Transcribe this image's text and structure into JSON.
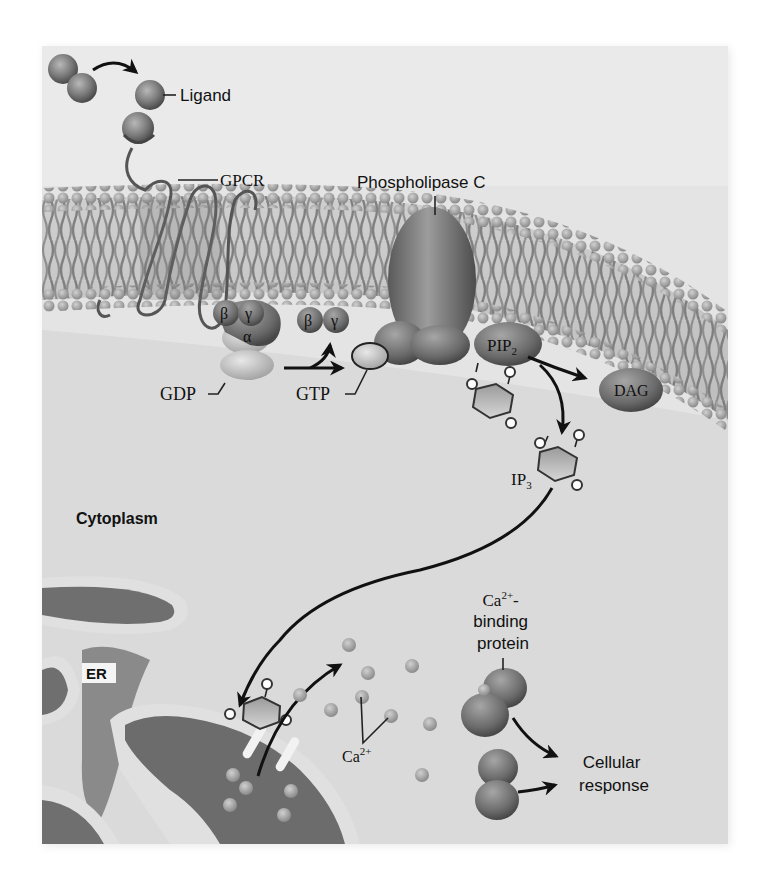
{
  "figure": {
    "background_color": "#dedede",
    "membrane_color": "#8e8e8e",
    "er_color": "#6f6f6f"
  },
  "labels": {
    "ligand": "Ligand",
    "gpcr": "GPCR",
    "phospholipase_c": "Phospholipase C",
    "beta": "β",
    "gamma": "γ",
    "alpha": "α",
    "gdp": "GDP",
    "gtp": "GTP",
    "pip2_main": "PIP",
    "pip2_sub": "2",
    "dag": "DAG",
    "ip3_main": "IP",
    "ip3_sub": "3",
    "cytoplasm": "Cytoplasm",
    "er": "ER",
    "ca_main": "Ca",
    "ca_sup": "2+",
    "ca_binding_line1_main": "Ca",
    "ca_binding_line1_sup": "2+",
    "ca_binding_line1_suffix": "-",
    "ca_binding_line2": "binding",
    "ca_binding_line3": "protein",
    "cellular_response_line1": "Cellular",
    "cellular_response_line2": "response"
  }
}
